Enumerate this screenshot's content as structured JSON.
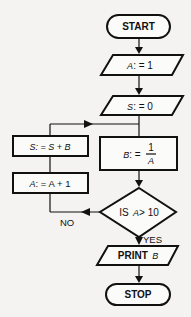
{
  "flowchart": {
    "start": {
      "label": "START"
    },
    "init_a": {
      "var": "A",
      "op": ": = 1"
    },
    "init_s": {
      "var": "S",
      "op": ": = 0"
    },
    "compute_b": {
      "var": "B",
      "op": ": =",
      "numerator": "1",
      "denominator": "A"
    },
    "decision": {
      "prefix": "IS",
      "var": "A",
      "op": "> 10"
    },
    "yes_label": "YES",
    "no_label": "NO",
    "accumulate": {
      "var": "S",
      "op": ": = S + B"
    },
    "increment": {
      "var": "A",
      "op": ": = A + 1"
    },
    "print": {
      "prefix": "PRINT",
      "var": "B"
    },
    "stop": {
      "label": "STOP"
    }
  },
  "colors": {
    "stroke": "#111111",
    "fill": "#fbfbfa",
    "background": "#f4f3f1"
  }
}
